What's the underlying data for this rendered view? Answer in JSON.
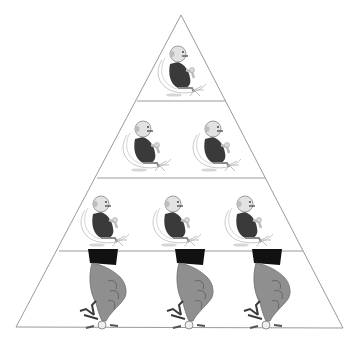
{
  "diagram": {
    "type": "pyramid",
    "tiers": [
      {
        "level": 1,
        "figures": 1,
        "figure_kind": "man-pushing-button"
      },
      {
        "level": 2,
        "figures": 2,
        "figure_kind": "man-pushing-button"
      },
      {
        "level": 3,
        "figures": 3,
        "figure_kind": "man-pushing-button"
      },
      {
        "level": 4,
        "figures": 3,
        "figure_kind": "hand-pressing-figure"
      }
    ],
    "colors": {
      "outline": "#9a9a9a",
      "figure_dark": "#3a3a3a",
      "figure_mid": "#8a8a8a",
      "figure_light": "#c8c8c8",
      "cuff": "#111111",
      "background": "#ffffff"
    }
  }
}
